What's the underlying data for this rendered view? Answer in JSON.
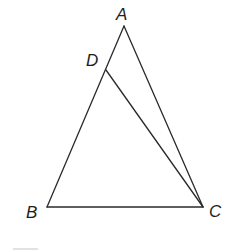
{
  "diagram": {
    "type": "triangle-with-cevian",
    "points": [
      {
        "id": "A",
        "label": "A"
      },
      {
        "id": "B",
        "label": "B"
      },
      {
        "id": "C",
        "label": "C"
      },
      {
        "id": "D",
        "label": "D",
        "on_segment": "AB"
      }
    ],
    "segments": [
      {
        "from": "A",
        "to": "B"
      },
      {
        "from": "B",
        "to": "C"
      },
      {
        "from": "C",
        "to": "A"
      },
      {
        "from": "D",
        "to": "C"
      }
    ],
    "line_color": "#2a2a2a",
    "label_color": "#1e1e1e"
  }
}
